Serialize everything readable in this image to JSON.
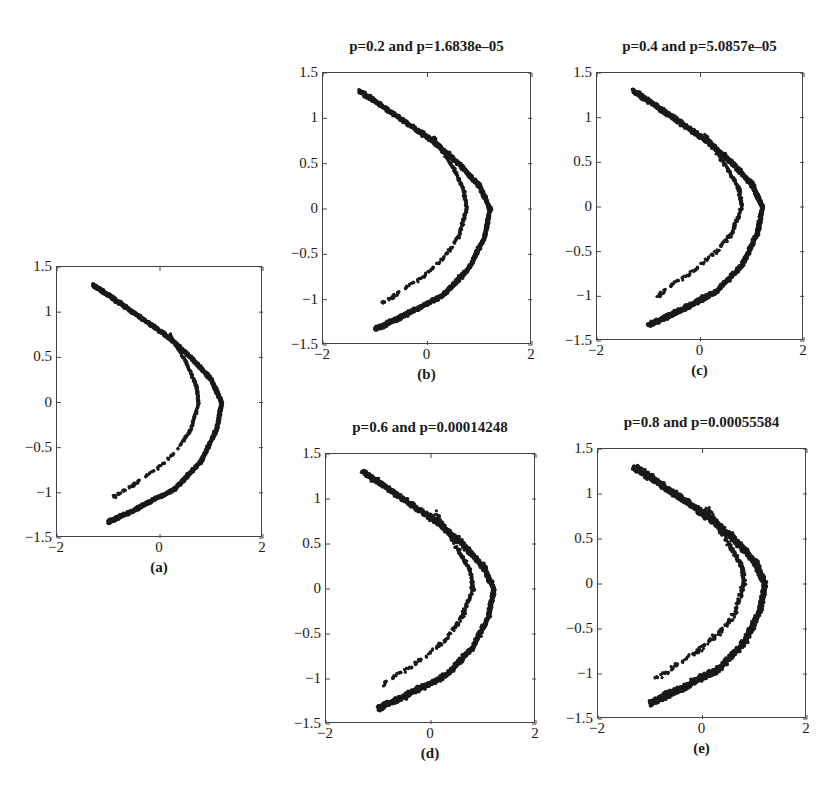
{
  "figure": {
    "panels": [
      {
        "id": "a",
        "title": "",
        "caption": "(a)",
        "box": {
          "left": 56,
          "top": 266,
          "width": 206,
          "height": 271
        },
        "noise": 0.025
      },
      {
        "id": "b",
        "title": "p=0.2 and p=1.6838e–05",
        "caption": "(b)",
        "box": {
          "left": 322,
          "top": 72,
          "width": 209,
          "height": 272
        },
        "noise": 0.03
      },
      {
        "id": "c",
        "title": "p=0.4 and p=5.0857e–05",
        "caption": "(c)",
        "box": {
          "left": 596,
          "top": 72,
          "width": 207,
          "height": 268
        },
        "noise": 0.035
      },
      {
        "id": "d",
        "title": "p=0.6 and p=0.00014248",
        "caption": "(d)",
        "box": {
          "left": 325,
          "top": 453,
          "width": 210,
          "height": 270
        },
        "noise": 0.04
      },
      {
        "id": "e",
        "title": "p=0.8 and p=0.00055584",
        "caption": "(e)",
        "box": {
          "left": 597,
          "top": 448,
          "width": 209,
          "height": 270
        },
        "noise": 0.05
      }
    ],
    "xticks": [
      "−2",
      "0",
      "2"
    ],
    "yticks": [
      "1.5",
      "1",
      "0.5",
      "0",
      "−0.5",
      "−1",
      "−1.5"
    ],
    "point_color": "#1a1a1a"
  },
  "chart_data": [
    {
      "type": "scatter",
      "title": "",
      "caption": "(a)",
      "xlim": [
        -2,
        2
      ],
      "ylim": [
        -1.5,
        1.5
      ],
      "xticks": [
        -2,
        0,
        2
      ],
      "yticks": [
        -1.5,
        -1,
        -0.5,
        0,
        0.5,
        1,
        1.5
      ],
      "grid": false,
      "series": [
        {
          "name": "outer branch",
          "x": [
            -1.3,
            -0.9,
            -0.4,
            0.1,
            0.6,
            1.0,
            1.2,
            1.1,
            0.8,
            0.3,
            -0.2,
            -0.6,
            -1.0
          ],
          "y": [
            1.3,
            1.15,
            0.95,
            0.75,
            0.5,
            0.25,
            0.0,
            -0.3,
            -0.65,
            -0.95,
            -1.1,
            -1.22,
            -1.32
          ]
        },
        {
          "name": "inner branch",
          "x": [
            0.2,
            0.5,
            0.7,
            0.75,
            0.6,
            0.3,
            -0.1,
            -0.5,
            -0.9
          ],
          "y": [
            0.75,
            0.45,
            0.2,
            0.0,
            -0.3,
            -0.55,
            -0.75,
            -0.9,
            -1.05
          ]
        }
      ]
    },
    {
      "type": "scatter",
      "title": "p=0.2 and p=1.6838e–05",
      "caption": "(b)",
      "xlim": [
        -2,
        2
      ],
      "ylim": [
        -1.5,
        1.5
      ],
      "xticks": [
        -2,
        0,
        2
      ],
      "yticks": [
        -1.5,
        -1,
        -0.5,
        0,
        0.5,
        1,
        1.5
      ],
      "grid": false,
      "series": [
        {
          "name": "outer branch",
          "x": [
            -1.3,
            -0.9,
            -0.4,
            0.1,
            0.6,
            1.0,
            1.2,
            1.1,
            0.8,
            0.3,
            -0.2,
            -0.6,
            -1.0
          ],
          "y": [
            1.3,
            1.15,
            0.95,
            0.75,
            0.5,
            0.25,
            0.0,
            -0.3,
            -0.65,
            -0.95,
            -1.1,
            -1.22,
            -1.32
          ]
        },
        {
          "name": "inner branch",
          "x": [
            0.1,
            0.5,
            0.7,
            0.75,
            0.6,
            0.3,
            -0.1,
            -0.5,
            -0.9
          ],
          "y": [
            0.8,
            0.45,
            0.2,
            0.0,
            -0.3,
            -0.55,
            -0.75,
            -0.9,
            -1.05
          ]
        }
      ]
    },
    {
      "type": "scatter",
      "title": "p=0.4 and p=5.0857e–05",
      "caption": "(c)",
      "xlim": [
        -2,
        2
      ],
      "ylim": [
        -1.5,
        1.5
      ],
      "xticks": [
        -2,
        0,
        2
      ],
      "yticks": [
        -1.5,
        -1,
        -0.5,
        0,
        0.5,
        1,
        1.5
      ],
      "grid": false,
      "series": [
        {
          "name": "outer branch",
          "x": [
            -1.3,
            -0.9,
            -0.4,
            0.1,
            0.6,
            1.0,
            1.2,
            1.1,
            0.8,
            0.3,
            -0.2,
            -0.6,
            -1.0
          ],
          "y": [
            1.3,
            1.15,
            0.95,
            0.75,
            0.5,
            0.25,
            0.0,
            -0.3,
            -0.65,
            -0.95,
            -1.1,
            -1.22,
            -1.32
          ]
        },
        {
          "name": "inner branch",
          "x": [
            0.1,
            0.5,
            0.75,
            0.8,
            0.6,
            0.3,
            -0.1,
            -0.5,
            -0.85
          ],
          "y": [
            0.8,
            0.45,
            0.2,
            0.0,
            -0.3,
            -0.5,
            -0.7,
            -0.85,
            -1.0
          ]
        }
      ]
    },
    {
      "type": "scatter",
      "title": "p=0.6 and p=0.00014248",
      "caption": "(d)",
      "xlim": [
        -2,
        2
      ],
      "ylim": [
        -1.5,
        1.5
      ],
      "xticks": [
        -2,
        0,
        2
      ],
      "yticks": [
        -1.5,
        -1,
        -0.5,
        0,
        0.5,
        1,
        1.5
      ],
      "grid": false,
      "series": [
        {
          "name": "outer branch",
          "x": [
            -1.3,
            -0.9,
            -0.4,
            0.1,
            0.6,
            1.0,
            1.2,
            1.1,
            0.8,
            0.3,
            -0.2,
            -0.6,
            -1.0
          ],
          "y": [
            1.3,
            1.15,
            0.95,
            0.75,
            0.5,
            0.25,
            0.0,
            -0.3,
            -0.65,
            -0.95,
            -1.1,
            -1.22,
            -1.32
          ]
        },
        {
          "name": "inner branch",
          "x": [
            0.1,
            0.5,
            0.75,
            0.8,
            0.6,
            0.3,
            -0.1,
            -0.5,
            -0.9
          ],
          "y": [
            0.85,
            0.45,
            0.2,
            0.0,
            -0.3,
            -0.55,
            -0.75,
            -0.9,
            -1.05
          ]
        }
      ]
    },
    {
      "type": "scatter",
      "title": "p=0.8 and p=0.00055584",
      "caption": "(e)",
      "xlim": [
        -2,
        2
      ],
      "ylim": [
        -1.5,
        1.5
      ],
      "xticks": [
        -2,
        0,
        2
      ],
      "yticks": [
        -1.5,
        -1,
        -0.5,
        0,
        0.5,
        1,
        1.5
      ],
      "grid": false,
      "series": [
        {
          "name": "outer branch",
          "x": [
            -1.3,
            -0.9,
            -0.4,
            0.1,
            0.6,
            1.0,
            1.2,
            1.1,
            0.8,
            0.3,
            -0.2,
            -0.6,
            -1.0
          ],
          "y": [
            1.3,
            1.15,
            0.95,
            0.75,
            0.5,
            0.25,
            0.0,
            -0.3,
            -0.65,
            -0.95,
            -1.1,
            -1.22,
            -1.32
          ]
        },
        {
          "name": "inner branch",
          "x": [
            0.1,
            0.5,
            0.75,
            0.8,
            0.6,
            0.3,
            -0.1,
            -0.5,
            -0.9
          ],
          "y": [
            0.85,
            0.45,
            0.2,
            0.0,
            -0.35,
            -0.55,
            -0.75,
            -0.9,
            -1.05
          ]
        }
      ]
    }
  ]
}
